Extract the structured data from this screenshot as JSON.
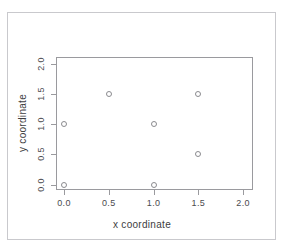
{
  "chart_data": {
    "type": "scatter",
    "title": "",
    "xlabel": "x coordinate",
    "ylabel": "y coordinate",
    "xlim": [
      -0.09,
      2.11
    ],
    "ylim": [
      -0.09,
      2.11
    ],
    "grid": false,
    "legend": null,
    "marker": "open-circle",
    "marker_color": "#8b8b8f",
    "xticks": [
      "0.0",
      "0.5",
      "1.0",
      "1.5",
      "2.0"
    ],
    "xtick_values": [
      0.0,
      0.5,
      1.0,
      1.5,
      2.0
    ],
    "yticks": [
      "0.0",
      "0.5",
      "1.0",
      "1.5",
      "2.0"
    ],
    "ytick_values": [
      0.0,
      0.5,
      1.0,
      1.5,
      2.0
    ],
    "points": [
      {
        "x": 0.0,
        "y": 0.0
      },
      {
        "x": 0.0,
        "y": 1.0
      },
      {
        "x": 0.5,
        "y": 1.5
      },
      {
        "x": 1.0,
        "y": 0.0
      },
      {
        "x": 1.0,
        "y": 1.0
      },
      {
        "x": 1.5,
        "y": 0.5
      },
      {
        "x": 1.5,
        "y": 1.5
      }
    ]
  },
  "style": {
    "axis_color": "#9a9a9e",
    "text_color": "#3d3d41",
    "page_border_color": "#c9c9cd",
    "background": "#ffffff"
  }
}
